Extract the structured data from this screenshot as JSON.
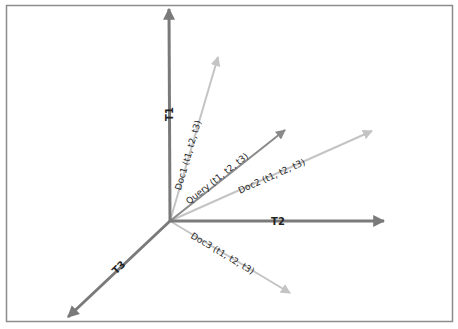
{
  "diagram": {
    "type": "3d-vector-space-model",
    "origin": [
      170,
      221
    ],
    "colors": {
      "frame": "#8c8c8c",
      "axis": "#7a7a7a",
      "query": "#8a8a8a",
      "doc": "#c4c4c4",
      "text": "#222222"
    },
    "axes": [
      {
        "id": "t1",
        "label": "T1",
        "tip": [
          169,
          9
        ]
      },
      {
        "id": "t2",
        "label": "T2",
        "tip": [
          384,
          221
        ]
      },
      {
        "id": "t3",
        "label": "T3",
        "tip": [
          68,
          317
        ]
      }
    ],
    "vectors": [
      {
        "id": "doc1",
        "label": "Doc1 (t1, t2, t3)",
        "tip": [
          218,
          57
        ]
      },
      {
        "id": "query",
        "label": "Query (t1, t2, t3)",
        "tip": [
          285,
          130
        ]
      },
      {
        "id": "doc2",
        "label": "Doc2 (t1, t2, t3)",
        "tip": [
          372,
          131
        ]
      },
      {
        "id": "doc3",
        "label": "Doc3 (t1, t2, t3)",
        "tip": [
          290,
          293
        ]
      }
    ]
  }
}
